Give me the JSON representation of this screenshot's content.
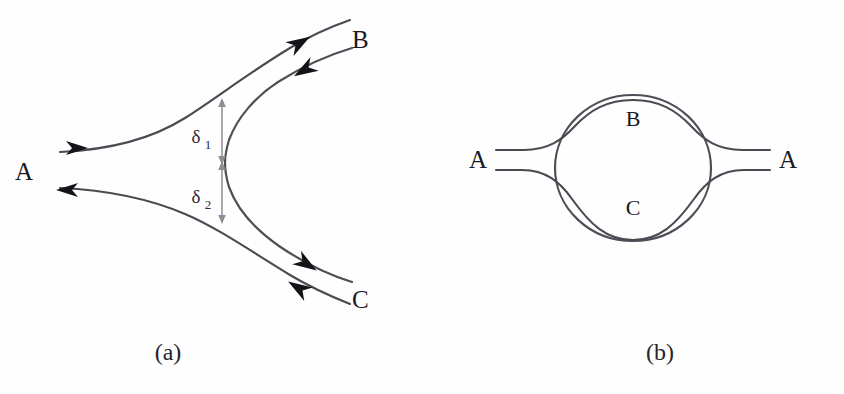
{
  "figure": {
    "background_color": "#fefefe",
    "line_color": "#4a4a52",
    "label_color": "#19191f",
    "measure_color": "#8d8d95",
    "arrow_color": "#131318"
  },
  "panel_a": {
    "caption": "(a)",
    "labels": {
      "a": "A",
      "b": "B",
      "c": "C",
      "delta1": "δ",
      "delta1_sub": "1",
      "delta2": "δ",
      "delta2_sub": "2"
    },
    "arrows": [
      {
        "name": "a-inflow",
        "direction": "right",
        "description": "flow entering junction from A"
      },
      {
        "name": "a-outflow",
        "direction": "left",
        "description": "flow leaving junction toward A"
      },
      {
        "name": "b-outflow",
        "direction": "up-right",
        "description": "flow leaving junction toward B"
      },
      {
        "name": "b-inflow",
        "direction": "down-left",
        "description": "flow entering junction from B"
      },
      {
        "name": "c-outflow",
        "direction": "down-right",
        "description": "flow leaving junction toward C"
      },
      {
        "name": "c-inflow",
        "direction": "up-left",
        "description": "flow entering junction from C"
      }
    ]
  },
  "panel_b": {
    "caption": "(b)",
    "labels": {
      "a_left": "A",
      "a_right": "A",
      "b": "B",
      "c": "C"
    }
  }
}
